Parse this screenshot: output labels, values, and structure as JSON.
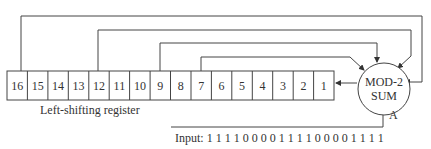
{
  "diagram": {
    "register_label": "Left-shifting register",
    "cells": [
      "16",
      "15",
      "14",
      "13",
      "12",
      "11",
      "10",
      "9",
      "8",
      "7",
      "6",
      "5",
      "4",
      "3",
      "2",
      "1"
    ],
    "taps": [
      "16",
      "12",
      "9",
      "7"
    ],
    "sum_line1": "MOD-2",
    "sum_line2": "SUM",
    "input_label": "Input: 1 1 1 1 0 0 0 0 1 1 1 1 0 0 0 0 1 1 1 1",
    "input_node_label": "A",
    "line_color": "#333333"
  }
}
